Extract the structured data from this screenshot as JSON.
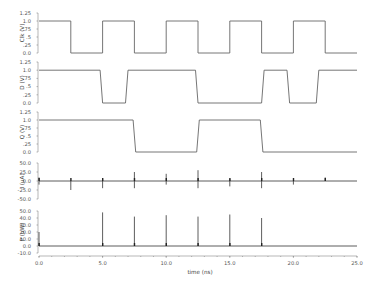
{
  "chart_data": {
    "type": "line",
    "title": "",
    "xlabel": "time (ns)",
    "xlim": [
      0,
      25
    ],
    "xticks": [
      "0.0",
      "5.0",
      "10.0",
      "15.0",
      "20.0",
      "25.0"
    ],
    "grid": false,
    "legend": null,
    "panels": [
      {
        "name": "Clk",
        "ylabel": "Clk (V)",
        "yticks": [
          "1.25",
          "1.0",
          ".75",
          ".5",
          ".25",
          "0.0"
        ],
        "ylim": [
          0,
          1.25
        ],
        "x": [
          0,
          2.5,
          2.5,
          5,
          5,
          7.5,
          7.5,
          10,
          10,
          12.5,
          12.5,
          15,
          15,
          17.5,
          17.5,
          20,
          20,
          22.5,
          22.5,
          25
        ],
        "y": [
          1,
          1,
          0,
          0,
          1,
          1,
          0,
          0,
          1,
          1,
          0,
          0,
          1,
          1,
          0,
          0,
          1,
          1,
          0,
          0
        ]
      },
      {
        "name": "D",
        "ylabel": "D (V)",
        "yticks": [
          "1.25",
          "1.0",
          ".75",
          ".5",
          ".25",
          "0.0"
        ],
        "ylim": [
          0,
          1.25
        ],
        "x": [
          0,
          4.8,
          5.0,
          6.8,
          7.0,
          12.3,
          12.5,
          17.5,
          17.7,
          19.5,
          19.7,
          21.8,
          22.0,
          25
        ],
        "y": [
          1,
          1,
          0,
          0,
          1,
          1,
          0,
          0,
          1,
          1,
          0,
          0,
          1,
          1
        ]
      },
      {
        "name": "Q",
        "ylabel": "Q (V)",
        "yticks": [
          "1.25",
          "1.0",
          ".75",
          ".5",
          ".25",
          "0.0"
        ],
        "ylim": [
          0,
          1.25
        ],
        "x": [
          0,
          7.4,
          7.6,
          12.4,
          12.6,
          17.4,
          17.6,
          25
        ],
        "y": [
          1,
          1,
          0,
          0,
          1,
          1,
          0,
          0
        ]
      },
      {
        "name": "I",
        "ylabel": "I (uA)",
        "yticks": [
          "50.0",
          "25.0",
          "0.0",
          "-25.0",
          "-50.0"
        ],
        "ylim": [
          -50,
          50
        ],
        "baseline": 0,
        "spikes": [
          {
            "t": 0.0,
            "up": 10,
            "down": -10
          },
          {
            "t": 2.5,
            "up": 0,
            "down": -25
          },
          {
            "t": 5.0,
            "up": 5,
            "down": -20
          },
          {
            "t": 7.5,
            "up": 25,
            "down": -20
          },
          {
            "t": 10.0,
            "up": 20,
            "down": -10
          },
          {
            "t": 12.5,
            "up": 30,
            "down": -20
          },
          {
            "t": 15.0,
            "up": 5,
            "down": -15
          },
          {
            "t": 17.5,
            "up": 25,
            "down": -20
          },
          {
            "t": 20.0,
            "up": 0,
            "down": -10
          },
          {
            "t": 22.5,
            "up": 10,
            "down": 0
          }
        ]
      },
      {
        "name": "P",
        "ylabel": "P (uW)",
        "yticks": [
          "50.0",
          "40.0",
          "30.0",
          "20.0",
          "10.0",
          "0.0",
          "-10.0"
        ],
        "ylim": [
          -10,
          50
        ],
        "baseline": 0,
        "spikes": [
          {
            "t": 0.0,
            "up": 20
          },
          {
            "t": 5.0,
            "up": 48
          },
          {
            "t": 7.5,
            "up": 42
          },
          {
            "t": 10.0,
            "up": 44
          },
          {
            "t": 12.5,
            "up": 42
          },
          {
            "t": 15.0,
            "up": 45
          },
          {
            "t": 17.5,
            "up": 40
          }
        ]
      }
    ]
  }
}
